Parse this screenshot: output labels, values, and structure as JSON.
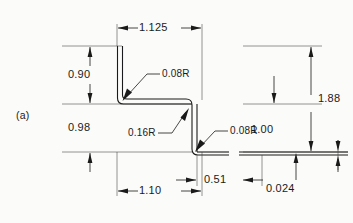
{
  "figure": {
    "label": "(a)",
    "type": "engineering-drawing",
    "units": "inches"
  },
  "dimensions": {
    "top_width": "1.125",
    "left_upper_height": "0.90",
    "left_lower_height": "0.98",
    "overall_height": "1.88",
    "right_flange_length": "1.00",
    "bottom_width": "1.10",
    "web_offset": "0.51",
    "material_thickness": "0.024"
  },
  "radii": {
    "upper_bend": "0.08R",
    "inner_bend": "0.16R",
    "lower_bend": "0.08R"
  },
  "colors": {
    "line": "#1a1a1a",
    "background": "#fbfbf9"
  }
}
